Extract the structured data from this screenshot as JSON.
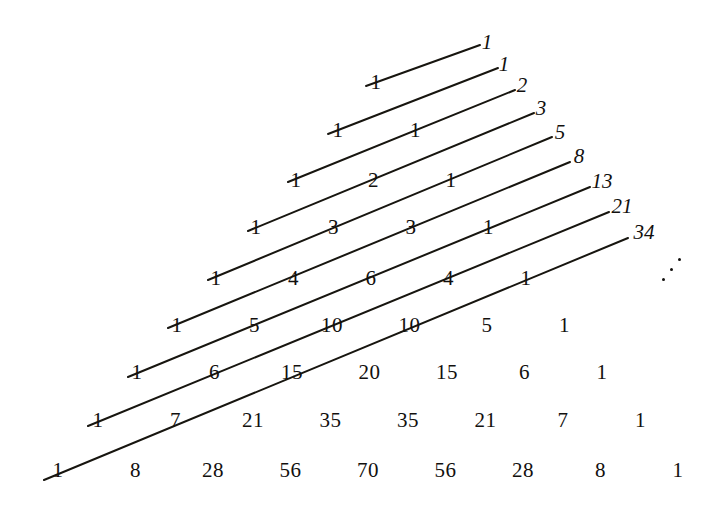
{
  "figure": {
    "background_color": "#ffffff",
    "ink_color": "#12100e"
  },
  "pascal_triangle": {
    "description": "Pascal's triangle rows 0 through 8, drawn as an inverted/right-leaning arrangement",
    "rows": [
      {
        "row_index": 0,
        "values": [
          "1"
        ],
        "baseline_y": 82,
        "start_x": 376
      },
      {
        "row_index": 1,
        "values": [
          "1",
          "1"
        ],
        "baseline_y": 130,
        "start_x": 338
      },
      {
        "row_index": 2,
        "values": [
          "1",
          "2",
          "1"
        ],
        "baseline_y": 180,
        "start_x": 296
      },
      {
        "row_index": 3,
        "values": [
          "1",
          "3",
          "3",
          "1"
        ],
        "baseline_y": 227,
        "start_x": 256
      },
      {
        "row_index": 4,
        "values": [
          "1",
          "4",
          "6",
          "4",
          "1"
        ],
        "baseline_y": 278,
        "start_x": 216
      },
      {
        "row_index": 5,
        "values": [
          "1",
          "5",
          "10",
          "10",
          "5",
          "1"
        ],
        "baseline_y": 325,
        "start_x": 177
      },
      {
        "row_index": 6,
        "values": [
          "1",
          "6",
          "15",
          "20",
          "15",
          "6",
          "1"
        ],
        "baseline_y": 372,
        "start_x": 137
      },
      {
        "row_index": 7,
        "values": [
          "1",
          "7",
          "21",
          "35",
          "35",
          "21",
          "7",
          "1"
        ],
        "baseline_y": 420,
        "start_x": 98
      },
      {
        "row_index": 8,
        "values": [
          "1",
          "8",
          "28",
          "56",
          "70",
          "56",
          "28",
          "8",
          "1"
        ],
        "baseline_y": 470,
        "start_x": 58
      }
    ],
    "column_spacing": 77.5
  },
  "diagonals": {
    "description": "Straight lines drawn through shallow diagonals of the triangle; each diagonal's entries sum to a Fibonacci number",
    "lines": [
      {
        "index": 0,
        "x1": 366,
        "y1": 86,
        "x2": 480,
        "y2": 45,
        "sum_label": "1"
      },
      {
        "index": 1,
        "x1": 328,
        "y1": 134,
        "x2": 498,
        "y2": 68,
        "sum_label": "1"
      },
      {
        "index": 2,
        "x1": 288,
        "y1": 182,
        "x2": 515,
        "y2": 90,
        "sum_label": "2"
      },
      {
        "index": 3,
        "x1": 248,
        "y1": 231,
        "x2": 534,
        "y2": 113,
        "sum_label": "3"
      },
      {
        "index": 4,
        "x1": 208,
        "y1": 280,
        "x2": 552,
        "y2": 137,
        "sum_label": "5"
      },
      {
        "index": 5,
        "x1": 168,
        "y1": 328,
        "x2": 570,
        "y2": 162,
        "sum_label": "8"
      },
      {
        "index": 6,
        "x1": 128,
        "y1": 377,
        "x2": 590,
        "y2": 187,
        "sum_label": "13"
      },
      {
        "index": 7,
        "x1": 88,
        "y1": 426,
        "x2": 609,
        "y2": 212,
        "sum_label": "21"
      },
      {
        "index": 8,
        "x1": 44,
        "y1": 480,
        "x2": 628,
        "y2": 238,
        "sum_label": "34"
      }
    ],
    "stroke_color": "#17150f",
    "stroke_width": 2.0
  },
  "fibonacci_labels": {
    "description": "Italic numerals at the upper-right end of each diagonal giving the diagonal sum",
    "items": [
      {
        "text": "1",
        "x": 487,
        "y": 42
      },
      {
        "text": "1",
        "x": 504,
        "y": 64
      },
      {
        "text": "2",
        "x": 522,
        "y": 85
      },
      {
        "text": "3",
        "x": 541,
        "y": 108
      },
      {
        "text": "5",
        "x": 560,
        "y": 132
      },
      {
        "text": "8",
        "x": 579,
        "y": 156
      },
      {
        "text": "13",
        "x": 602,
        "y": 181
      },
      {
        "text": "21",
        "x": 622,
        "y": 206
      },
      {
        "text": "34",
        "x": 644,
        "y": 232
      }
    ]
  },
  "continuation_marker": {
    "name": "diagonal-ellipsis",
    "glyph": "⋰",
    "x": 660,
    "y": 258
  }
}
